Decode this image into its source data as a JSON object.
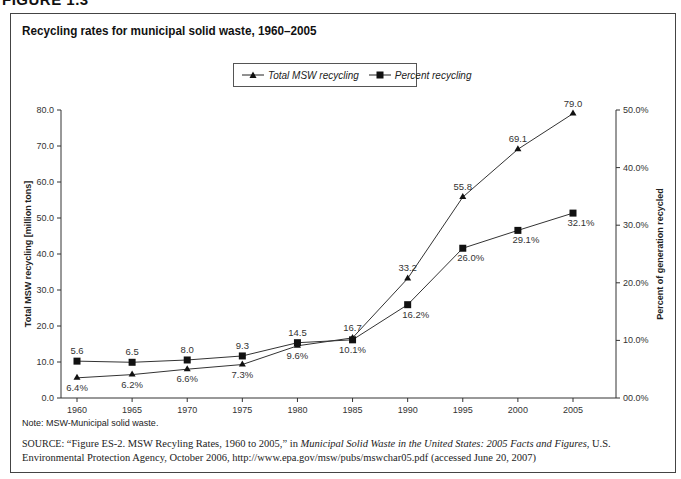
{
  "figure_label": "FIGURE 1.3",
  "title": "Recycling rates for municipal solid waste, 1960–2005",
  "legend": [
    {
      "label": "Total MSW recycling",
      "marker": "triangle"
    },
    {
      "label": "Percent recycling",
      "marker": "square"
    }
  ],
  "note": "Note: MSW-Municipal solid waste.",
  "source": {
    "prefix": "SOURCE:",
    "text1": " “Figure ES-2. MSW Recyling Rates, 1960 to 2005,” in ",
    "italic": "Municipal Solid Waste in the United States: 2005 Facts and Figures",
    "text2": ", U.S. Environmental Protection Agency, October 2006, http://www.epa.gov/msw/pubs/mswchar05.pdf (accessed June 20, 2007)"
  },
  "chart_data": {
    "type": "line",
    "title": "Recycling rates for municipal solid waste, 1960–2005",
    "xlabel": "",
    "ylabel": "Total MSW recycling [million tons]",
    "y2label": "Percent of generation recycled",
    "categories": [
      "1960",
      "1965",
      "1970",
      "1975",
      "1980",
      "1985",
      "1990",
      "1995",
      "2000",
      "2005"
    ],
    "ylim": [
      0,
      80
    ],
    "y2lim": [
      0,
      50
    ],
    "yticks": [
      "0.0",
      "10.0",
      "20.0",
      "30.0",
      "40.0",
      "50.0",
      "60.0",
      "70.0",
      "80.0"
    ],
    "y2ticks": [
      "00.0%",
      "10.0%",
      "20.0%",
      "30.0%",
      "40.0%",
      "50.0%"
    ],
    "grid": false,
    "legend_position": "top-center",
    "series": [
      {
        "name": "Total MSW recycling",
        "axis": "left",
        "marker": "triangle",
        "values": [
          5.6,
          6.5,
          8.0,
          9.3,
          14.5,
          16.7,
          33.2,
          55.8,
          69.1,
          79.0
        ]
      },
      {
        "name": "Percent recycling",
        "axis": "right",
        "marker": "square",
        "values": [
          6.4,
          6.2,
          6.6,
          7.3,
          9.6,
          10.1,
          16.2,
          26.0,
          29.1,
          32.1
        ]
      }
    ],
    "data_labels": {
      "upper": [
        "5.6",
        "6.5",
        "8.0",
        "9.3",
        "14.5",
        "16.7",
        "33.2",
        "55.8",
        "69.1",
        "79.0"
      ],
      "lower": [
        "6.4%",
        "6.2%",
        "6.6%",
        "7.3%",
        "9.6%",
        "10.1%",
        "16.2%",
        "26.0%",
        "29.1%",
        "32.1%"
      ]
    }
  }
}
